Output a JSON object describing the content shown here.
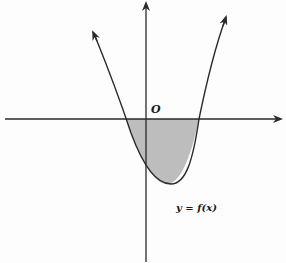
{
  "diagram": {
    "title": "",
    "origin_label": "O",
    "curve_label": "y = f(x)",
    "colors": {
      "line": "#2a2a2a",
      "shade": "#bdbdbd",
      "background": "#fdfdfd"
    },
    "axes": {
      "x_axis": {
        "y": 119,
        "x_start": 5,
        "x_end": 281,
        "arrow": "right"
      },
      "y_axis": {
        "x": 146,
        "y_start": 262,
        "y_end": 2,
        "arrow": "up"
      }
    },
    "parabola": {
      "opens": "up",
      "roots_px": [
        126,
        199
      ],
      "vertex_px": [
        171,
        184
      ],
      "y_intercept_px": [
        146,
        160
      ],
      "left_arm_tip_px": [
        93,
        32
      ],
      "right_arm_tip_px": [
        226,
        17
      ]
    },
    "shaded_region": "area between the curve and the x-axis where f(x) < 0"
  }
}
